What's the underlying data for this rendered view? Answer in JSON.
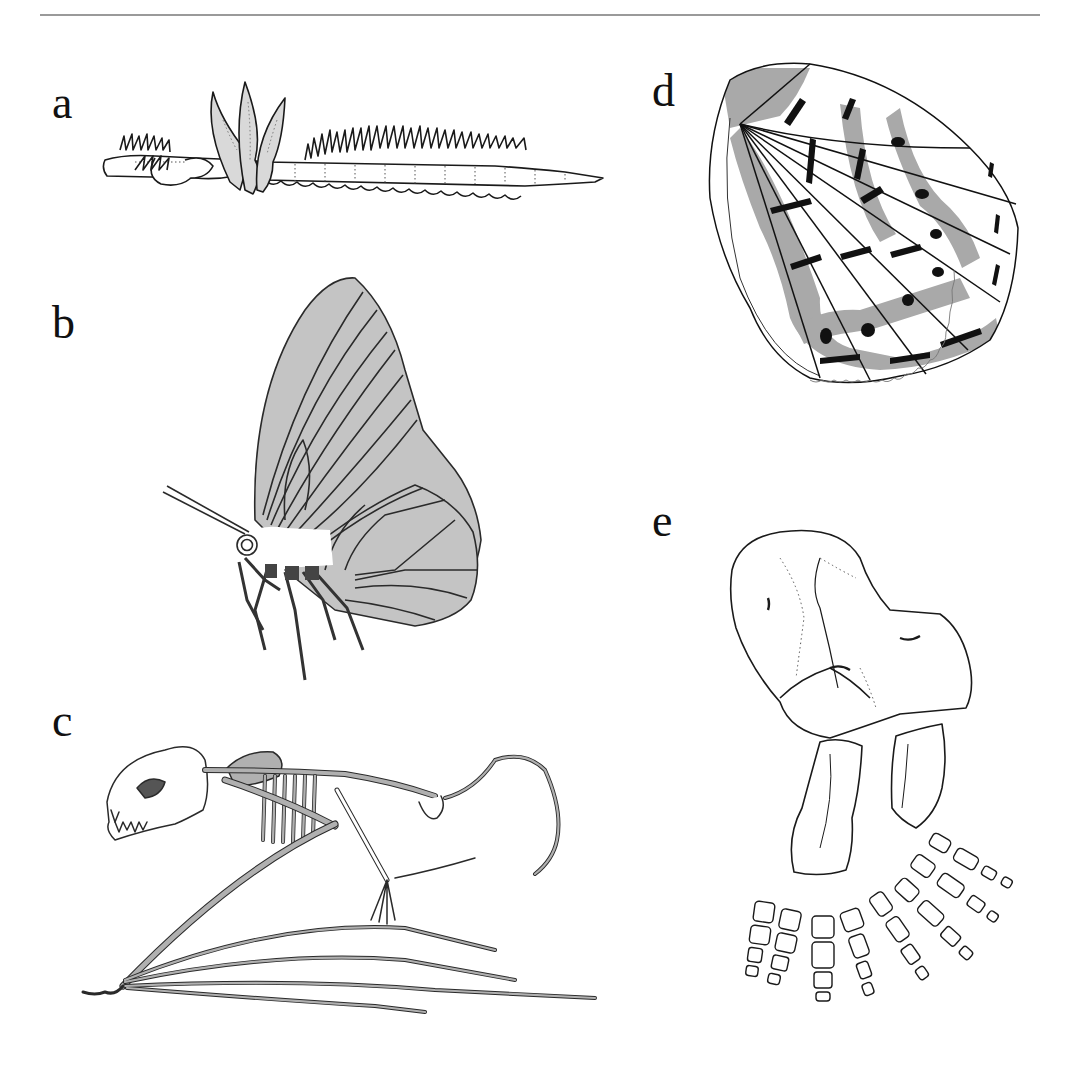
{
  "figure": {
    "top_rule": true,
    "colors": {
      "background": "#ffffff",
      "ink": "#1a1a1a",
      "rule": "#9a9a9a",
      "fill_light_gray": "#c4c4c4",
      "fill_mid_gray": "#b0b0b0",
      "fill_wing_gray": "#a9a9a9",
      "fill_worm_gills": "#d9d9d9"
    },
    "panels": [
      {
        "id": "a",
        "label": "a",
        "subject": "segmented worm with parapodia and raised gill plumes"
      },
      {
        "id": "b",
        "label": "b",
        "subject": "butterfly in lateral view with folded gray wings"
      },
      {
        "id": "c",
        "label": "c",
        "subject": "bat skeleton in lateral view with elongated wing digits"
      },
      {
        "id": "d",
        "label": "d",
        "subject": "butterfly hindwing showing eyespot and band pattern"
      },
      {
        "id": "e",
        "label": "e",
        "subject": "fossil limb bones with carpals and phalanges"
      }
    ]
  }
}
